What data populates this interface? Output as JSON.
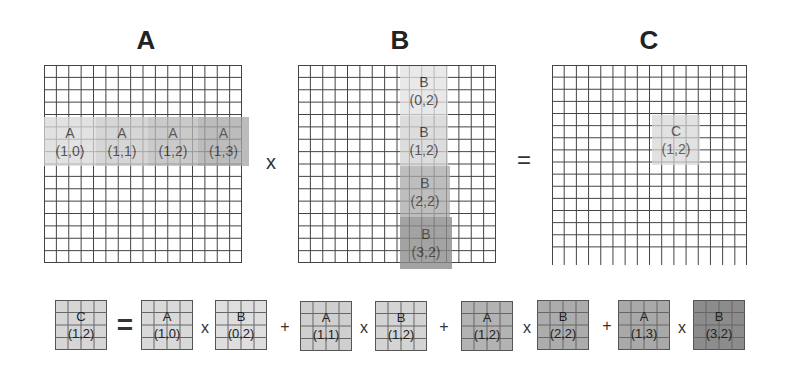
{
  "matrices": {
    "a": {
      "title": "A"
    },
    "b": {
      "title": "B"
    },
    "c": {
      "title": "C"
    }
  },
  "operators": {
    "times": "x",
    "equals": "=",
    "plus": "+"
  },
  "grid": {
    "rows": 16,
    "cols": 16,
    "line_color": "#444444"
  },
  "a_tiles": [
    {
      "name": "A",
      "index": "(1,0)",
      "color": "#d9d9d9"
    },
    {
      "name": "A",
      "index": "(1,1)",
      "color": "#c9c9c9"
    },
    {
      "name": "A",
      "index": "(1,2)",
      "color": "#b9b9b9"
    },
    {
      "name": "A",
      "index": "(1,3)",
      "color": "#a6a6a6"
    }
  ],
  "b_tiles": [
    {
      "name": "B",
      "index": "(0,2)",
      "color": "#e2e2e2"
    },
    {
      "name": "B",
      "index": "(1,2)",
      "color": "#d2d2d2"
    },
    {
      "name": "B",
      "index": "(2,2)",
      "color": "#a9a9a9"
    },
    {
      "name": "B",
      "index": "(3,2)",
      "color": "#8a8a8a"
    }
  ],
  "c_tile": {
    "name": "C",
    "index": "(1,2)",
    "color": "#d6d6d6"
  },
  "equation": {
    "lhs": {
      "name": "C",
      "index": "(1,2)",
      "color": "#d6d6d6"
    },
    "terms": [
      {
        "a": {
          "name": "A",
          "index": "(1,0)",
          "color": "#d9d9d9"
        },
        "b": {
          "name": "B",
          "index": "(0,2)",
          "color": "#dedede"
        }
      },
      {
        "a": {
          "name": "A",
          "index": "(1,1)",
          "color": "#cfcfcf"
        },
        "b": {
          "name": "B",
          "index": "(1,2)",
          "color": "#d4d4d4"
        }
      },
      {
        "a": {
          "name": "A",
          "index": "(1,2)",
          "color": "#b3b3b3"
        },
        "b": {
          "name": "B",
          "index": "(2,2)",
          "color": "#acacac"
        }
      },
      {
        "a": {
          "name": "A",
          "index": "(1,3)",
          "color": "#a9a9a9"
        },
        "b": {
          "name": "B",
          "index": "(3,2)",
          "color": "#8c8c8c"
        }
      }
    ]
  }
}
